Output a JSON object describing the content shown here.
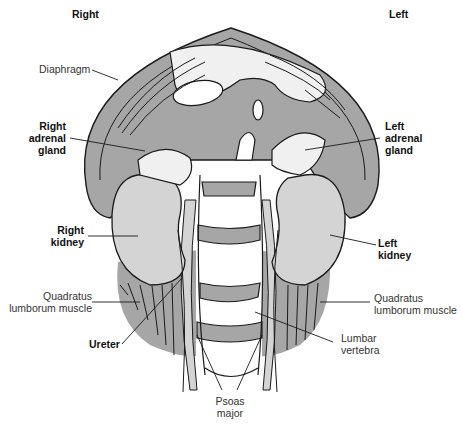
{
  "orientation": {
    "right": "Right",
    "left": "Left"
  },
  "labels": {
    "diaphragm": "Diaphragm",
    "right_adrenal": [
      "Right",
      "adrenal",
      "gland"
    ],
    "left_adrenal": [
      "Left",
      "adrenal",
      "gland"
    ],
    "right_kidney": [
      "Right",
      "kidney"
    ],
    "left_kidney": [
      "Left",
      "kidney"
    ],
    "quadratus_right": [
      "Quadratus",
      "lumborum muscle"
    ],
    "quadratus_left": [
      "Quadratus",
      "lumborum muscle"
    ],
    "ureter": "Ureter",
    "lumbar_vertebra": [
      "Lumbar",
      "vertebra"
    ],
    "psoas_major": [
      "Psoas",
      "major"
    ]
  },
  "colors": {
    "muscle_gray": "#a6a6a6",
    "organ_light": "#d4d4d4",
    "pale": "#f0f0f0",
    "outline": "#1a1a1a"
  }
}
